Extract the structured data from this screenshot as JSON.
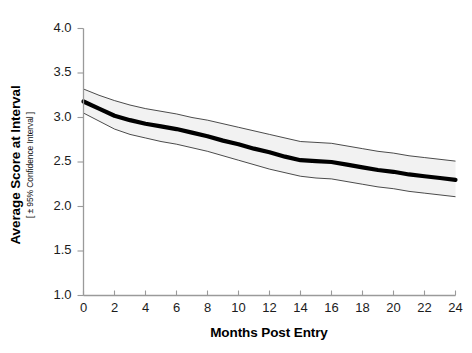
{
  "chart_data": {
    "type": "line",
    "title": "",
    "xlabel": "Months Post Entry",
    "ylabel": "Average Score at Interval",
    "ylabel_sub": "[ ± 95% Confidence Interval ]",
    "xlim": [
      0,
      24
    ],
    "ylim": [
      1.0,
      4.0
    ],
    "xticks": [
      0,
      2,
      4,
      6,
      8,
      10,
      12,
      14,
      16,
      18,
      20,
      22,
      24
    ],
    "yticks": [
      1.0,
      1.5,
      2.0,
      2.5,
      3.0,
      3.5,
      4.0
    ],
    "xtick_labels": [
      "0",
      "2",
      "4",
      "6",
      "8",
      "10",
      "12",
      "14",
      "16",
      "18",
      "20",
      "22",
      "24"
    ],
    "ytick_labels": [
      "1.0",
      "1.5",
      "2.0",
      "2.5",
      "3.0",
      "3.5",
      "4.0"
    ],
    "grid": false,
    "legend": "none",
    "x": [
      0,
      1,
      2,
      3,
      4,
      5,
      6,
      7,
      8,
      9,
      10,
      11,
      12,
      13,
      14,
      15,
      16,
      17,
      18,
      19,
      20,
      21,
      22,
      23,
      24
    ],
    "series": [
      {
        "name": "Average Score at Interval",
        "color": "#000000",
        "linewidth": 4.2,
        "values": [
          3.18,
          3.1,
          3.02,
          2.97,
          2.93,
          2.9,
          2.87,
          2.83,
          2.79,
          2.74,
          2.7,
          2.65,
          2.61,
          2.56,
          2.52,
          2.51,
          2.5,
          2.47,
          2.44,
          2.41,
          2.39,
          2.36,
          2.34,
          2.32,
          2.3
        ]
      },
      {
        "name": "Upper 95% Confidence Limit",
        "color": "#000000",
        "linewidth": 0.7,
        "values": [
          3.32,
          3.25,
          3.19,
          3.14,
          3.1,
          3.07,
          3.04,
          3.0,
          2.97,
          2.93,
          2.89,
          2.85,
          2.81,
          2.77,
          2.73,
          2.72,
          2.71,
          2.68,
          2.65,
          2.62,
          2.6,
          2.57,
          2.55,
          2.53,
          2.51
        ]
      },
      {
        "name": "Lower 95% Confidence Limit",
        "color": "#000000",
        "linewidth": 0.7,
        "values": [
          3.05,
          2.96,
          2.87,
          2.81,
          2.77,
          2.73,
          2.7,
          2.66,
          2.62,
          2.57,
          2.52,
          2.47,
          2.42,
          2.38,
          2.34,
          2.32,
          2.31,
          2.28,
          2.25,
          2.22,
          2.2,
          2.17,
          2.15,
          2.13,
          2.11
        ]
      }
    ],
    "band_fill": "#f2f2f2",
    "axis_color": "#9a9a9a",
    "background": "#ffffff"
  }
}
